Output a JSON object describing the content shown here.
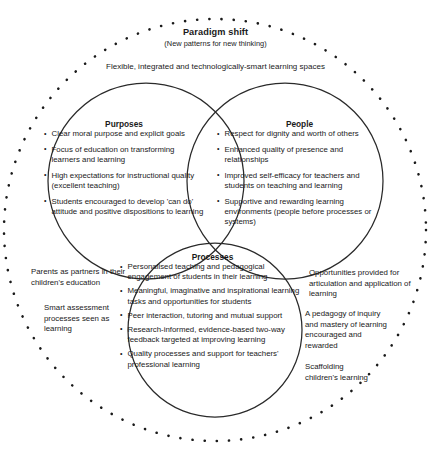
{
  "header": {
    "title": "Paradigm shift",
    "subtitle": "(New patterns for new thinking)",
    "band": "Flexible, integrated and technologically-smart learning spaces"
  },
  "circles": [
    {
      "id": "purposes",
      "heading": "Purposes",
      "items": [
        "Clear moral purpose and explicit goals",
        "Focus of education on transforming learners and learning",
        "High expectations for instructional quality (excellent teaching)",
        "Students encouraged to develop 'can do' attitude and positive dispositions to learning"
      ]
    },
    {
      "id": "people",
      "heading": "People",
      "items": [
        "Respect for dignity and worth of others",
        "Enhanced quality of presence and relationships",
        "Improved self-efficacy for teachers and students on teaching and learning",
        "Supportive and rewarding learning environments (people before processes or systems)"
      ]
    },
    {
      "id": "processes",
      "heading": "Processes",
      "items": [
        "Personalised teaching and pedagogical engagement of students in their learning",
        "Meaningful, imaginative and inspirational learning tasks and opportunities for students",
        "Peer interaction, tutoring and mutual support",
        "Research-informed, evidence-based two-way feedback targeted at improving learning",
        "Quality processes and support for teachers' professional learning"
      ]
    }
  ],
  "annotations": [
    {
      "id": "parents",
      "text": "Parents as partners in their children's education"
    },
    {
      "id": "assessment",
      "text": "Smart assessment processes seen as learning"
    },
    {
      "id": "opportunities",
      "text": "Opportunities provided for articulation and application of learning"
    },
    {
      "id": "pedagogy",
      "text": "A pedagogy of inquiry and mastery of learning encouraged and rewarded"
    },
    {
      "id": "scaffolding",
      "text": "Scaffolding children's learning"
    }
  ],
  "style": {
    "stroke": "#1a1a1a",
    "background": "#ffffff"
  }
}
